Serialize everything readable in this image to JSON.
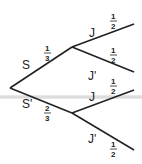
{
  "tree": {
    "root": {
      "x": 10,
      "y": 88
    },
    "level1": [
      {
        "label": "S",
        "prob_num": "1",
        "prob_den": "3",
        "node": {
          "x": 72,
          "y": 47
        }
      },
      {
        "label": "S'",
        "prob_num": "2",
        "prob_den": "3",
        "node": {
          "x": 72,
          "y": 113
        }
      }
    ],
    "level2_upper": [
      {
        "label": "J",
        "prob_num": "1",
        "prob_den": "2",
        "end": {
          "x": 134,
          "y": 24
        }
      },
      {
        "label": "J'",
        "prob_num": "1",
        "prob_den": "2",
        "end": {
          "x": 134,
          "y": 72
        }
      }
    ],
    "level2_lower": [
      {
        "label": "J",
        "prob_num": "1",
        "prob_den": "2",
        "end": {
          "x": 134,
          "y": 90
        }
      },
      {
        "label": "J'",
        "prob_num": "1",
        "prob_den": "2",
        "end": {
          "x": 134,
          "y": 150
        }
      }
    ]
  },
  "colors": {
    "line": "#222222",
    "band": "#dcdcdc"
  }
}
